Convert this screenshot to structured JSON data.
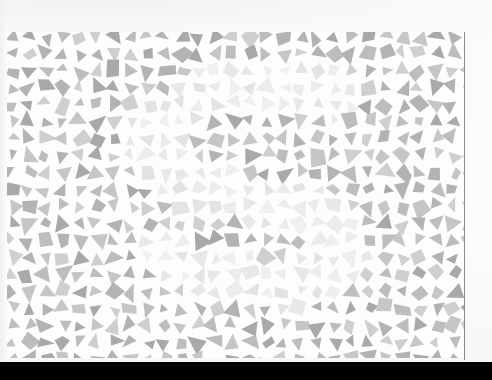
{
  "scene": {
    "description": "Photographed printed card with a mosaic of gray triangular and quadrilateral shards on white; lighter shards form a faint hidden curved figure",
    "background_color": "#fcfcfc",
    "bottom_band_color": "#000000",
    "edge_line_color": "#8a8a8a"
  },
  "mosaic": {
    "bounds": {
      "x": 7,
      "y": 32,
      "width": 457,
      "height": 326
    },
    "cell_size": 17,
    "shard_colors_dark": [
      "#a9a9a9",
      "#b3b3b3",
      "#bdbdbd",
      "#c6c6c6",
      "#cfcfcf"
    ],
    "shard_colors_light": [
      "#e3e3e3",
      "#e8e8e8",
      "#ececec",
      "#efefef"
    ],
    "hidden_figure_path": [
      [
        330,
        95
      ],
      [
        270,
        80
      ],
      [
        200,
        95
      ],
      [
        150,
        140
      ],
      [
        175,
        180
      ],
      [
        250,
        200
      ],
      [
        320,
        215
      ],
      [
        345,
        255
      ],
      [
        300,
        285
      ],
      [
        220,
        280
      ],
      [
        160,
        250
      ]
    ],
    "hidden_figure_width": 26,
    "seed": 1337
  }
}
